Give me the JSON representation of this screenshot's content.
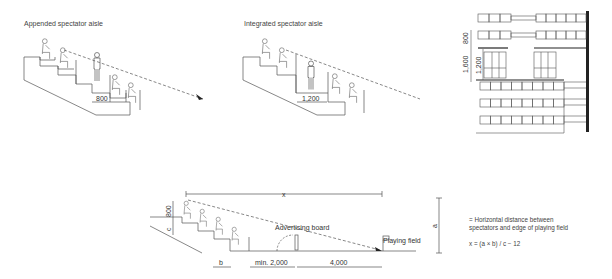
{
  "panels": {
    "appended": {
      "title": "Appended spectator aisle",
      "aisle_width": "800"
    },
    "integrated": {
      "title": "Integrated spectator aisle",
      "aisle_width": "1,200"
    },
    "plan": {
      "dim_row": "800",
      "dim_total": "1,600",
      "dim_aisle": "1,200"
    },
    "sightline": {
      "dim_x": "x",
      "dim_eye": "800",
      "dim_c": "c",
      "dim_b": "b",
      "dim_min": "min. 2,000",
      "dim_field": "4,000",
      "dim_a": "a",
      "advertising_label": "Advertising board",
      "field_label": "Playing field"
    }
  },
  "legend": {
    "definition": "= Horizontal distance between spectators and edge of playing field",
    "definition_line1": "= Horizontal distance between",
    "definition_line2": "spectators and edge of playing field",
    "formula": "x = (a × b) / c − 12"
  },
  "colors": {
    "line": "#555555",
    "text": "#444444",
    "wall": "#222222"
  }
}
